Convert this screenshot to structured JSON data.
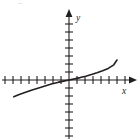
{
  "figure": {
    "title": "",
    "corner_mark": "..",
    "axis_labels": {
      "x": "x",
      "y": "y"
    },
    "colors": {
      "stroke": "#231f20",
      "background": "#ffffff",
      "faint": "#b9b9bb"
    }
  },
  "chart_data": {
    "type": "line",
    "title": "",
    "xlabel": "x",
    "ylabel": "y",
    "grid": false,
    "legend": null,
    "axes": {
      "origin_px": [
        69,
        80
      ],
      "tick_spacing_px": 8,
      "x_axis_ticks_left": 8,
      "x_axis_ticks_right": 7,
      "y_axis_ticks_up": 8,
      "y_axis_ticks_down": 7,
      "xlim": [
        -8.5,
        8.5
      ],
      "ylim": [
        -8.5,
        8.5
      ],
      "x_tick_labels": [],
      "y_tick_labels": [],
      "arrows": [
        "x-positive",
        "y-positive"
      ]
    },
    "series": [
      {
        "name": "curve",
        "x": [
          -6.9,
          -6.3,
          -5.6,
          -4.9,
          -4.2,
          -3.5,
          -2.8,
          -2.1,
          -1.4,
          -0.7,
          0,
          0.7,
          1.4,
          2.1,
          2.8,
          3.5,
          4.2,
          4.9,
          5.6,
          6.0
        ],
        "y": [
          -2.1,
          -1.85,
          -1.6,
          -1.35,
          -1.12,
          -0.9,
          -0.68,
          -0.48,
          -0.3,
          -0.14,
          0,
          0.14,
          0.3,
          0.48,
          0.68,
          0.9,
          1.15,
          1.45,
          1.9,
          2.5
        ]
      }
    ]
  }
}
